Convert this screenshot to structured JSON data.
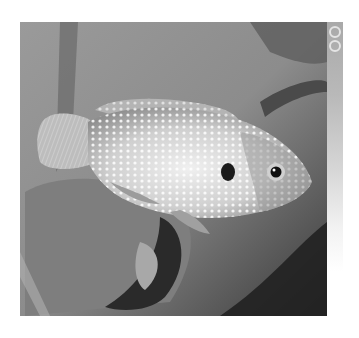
{
  "image": {
    "subject": "jewel cichlid fish",
    "alt": "Grayscale photograph of a spotted fish swimming among plant leaves",
    "palette": {
      "background": "#8a8a8a",
      "dark_shadow": "#2a2a2a",
      "fish_body": "#d8d8d8",
      "fish_spots": "#f4f4f4",
      "eye": "#111111"
    }
  },
  "side_strip": {
    "icons": [
      {
        "name": "ring-icon",
        "index": 1
      },
      {
        "name": "ring-icon",
        "index": 2
      }
    ]
  }
}
